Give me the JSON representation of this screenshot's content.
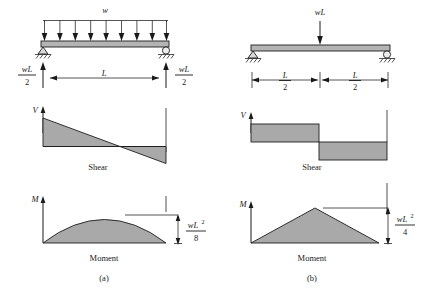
{
  "figure": {
    "panels": [
      {
        "id": "a",
        "caption": "(a)",
        "load_label": "w",
        "load_type": "uniform-distributed",
        "span_label": "L",
        "reaction_left": {
          "numerator": "wL",
          "denominator": "2"
        },
        "reaction_right": {
          "numerator": "wL",
          "denominator": "2"
        },
        "shear": {
          "axis_label": "V",
          "caption": "Shear",
          "shape": "linear-descending",
          "start_value": "wL/2",
          "end_value": "-wL/2",
          "zero_crossing": "midspan"
        },
        "moment": {
          "axis_label": "M",
          "caption": "Moment",
          "shape": "parabola",
          "peak_numerator": "wL",
          "peak_exponent": "2",
          "peak_denominator": "8",
          "peak_location": "midspan"
        }
      },
      {
        "id": "b",
        "caption": "(b)",
        "load_label": "wL",
        "load_type": "point-load-midspan",
        "dim_left": {
          "numerator": "L",
          "denominator": "2"
        },
        "dim_right": {
          "numerator": "L",
          "denominator": "2"
        },
        "shear": {
          "axis_label": "V",
          "caption": "Shear",
          "shape": "step",
          "start_value": "wL/2",
          "end_value": "-wL/2",
          "step_location": "midspan"
        },
        "moment": {
          "axis_label": "M",
          "caption": "Moment",
          "shape": "triangle",
          "peak_numerator": "wL",
          "peak_exponent": "2",
          "peak_denominator": "4",
          "peak_location": "midspan"
        }
      }
    ],
    "colors": {
      "diagram_fill": "#a9a9a9",
      "beam_fill": "#b4b4b4",
      "line": "#1e1e1e",
      "background": "#ffffff"
    }
  }
}
